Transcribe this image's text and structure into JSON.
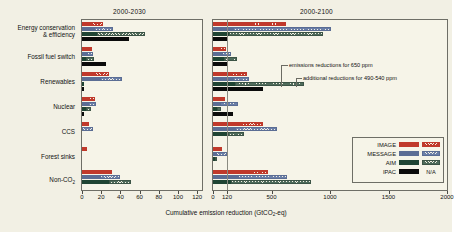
{
  "chart_data": {
    "type": "bar",
    "title": "",
    "xlabel": "Cumulative emission reduction (GtCO2-eq)",
    "xlabel_prefix": "Cumulative emission reduction (GtCO",
    "xlabel_sub": "2",
    "xlabel_suffix": "-eq)",
    "ylabel": "",
    "orientation": "horizontal",
    "grid": false,
    "legend_position": "bottom-right",
    "categories": [
      "Energy conservation\n& efficiency",
      "Fossil fuel switch",
      "Renewables",
      "Nuclear",
      "CCS",
      "Forest sinks",
      "Non-CO2"
    ],
    "legend": [
      {
        "name": "IMAGE",
        "solid_color": "#c0392b",
        "hatch": true,
        "note": ""
      },
      {
        "name": "MESSAGE",
        "solid_color": "#5b6d94",
        "hatch": true,
        "note": ""
      },
      {
        "name": "AIM",
        "solid_color": "#1f4433",
        "hatch": true,
        "note": ""
      },
      {
        "name": "IPAC",
        "solid_color": "#0b0b0b",
        "hatch": false,
        "note": "N/A"
      }
    ],
    "annotations": [
      "emissions reductions for 650 ppm",
      "additional reductions for 490-540 ppm"
    ],
    "panels": [
      {
        "title": "2000-2030",
        "xlim": [
          0,
          125
        ],
        "xticks": [
          0,
          20,
          40,
          60,
          80,
          100,
          120
        ],
        "xticklabels": [
          "0",
          "20",
          "40",
          "60",
          "80",
          "100",
          "120"
        ],
        "series": [
          {
            "name": "IMAGE",
            "base": [
              10,
              8,
              14,
              7,
              0,
              5,
              24
            ],
            "additional": [
              22,
              9,
              28,
              14,
              7,
              3,
              31
            ]
          },
          {
            "name": "MESSAGE",
            "base": [
              12,
              5,
              19,
              6,
              0,
              0,
              19
            ],
            "additional": [
              32,
              11,
              42,
              15,
              11,
              0,
              40
            ]
          },
          {
            "name": "AIM",
            "base": [
              16,
              4,
              2,
              4,
              0,
              0,
              28
            ],
            "additional": [
              66,
              13,
              2,
              9,
              0,
              0,
              51
            ]
          },
          {
            "name": "IPAC",
            "base": [
              49,
              25,
              2,
              2,
              0,
              0,
              0
            ],
            "additional": [
              0,
              0,
              0,
              0,
              0,
              0,
              0
            ]
          }
        ]
      },
      {
        "title": "2000-2100",
        "xlim": [
          0,
          2000
        ],
        "xticks": [
          0,
          120,
          500,
          1000,
          1500,
          2000
        ],
        "xticklabels": [
          "0",
          "120",
          "500",
          "1000",
          "1500",
          "2000"
        ],
        "series": [
          {
            "name": "IMAGE",
            "base": [
              270,
              60,
              150,
              45,
              240,
              60,
              330
            ],
            "additional": [
              620,
              115,
              290,
              100,
              425,
              80,
              470
            ]
          },
          {
            "name": "MESSAGE",
            "base": [
              175,
              75,
              175,
              60,
              190,
              25,
              215
            ],
            "additional": [
              1010,
              150,
              310,
              215,
              550,
              120,
              630
            ]
          },
          {
            "name": "AIM",
            "base": [
              140,
              95,
              190,
              30,
              125,
              20,
              150
            ],
            "additional": [
              940,
              205,
              780,
              70,
              265,
              25,
              840
            ]
          },
          {
            "name": "IPAC",
            "base": [
              120,
              130,
              430,
              175,
              0,
              0,
              0
            ],
            "additional": [
              0,
              0,
              0,
              0,
              0,
              0,
              0
            ]
          }
        ]
      }
    ]
  }
}
